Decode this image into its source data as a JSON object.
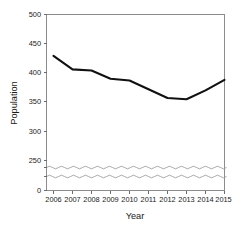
{
  "chart_data": {
    "type": "line",
    "title": "",
    "xlabel": "Year",
    "ylabel": "Population",
    "categories": [
      "2006",
      "2007",
      "2008",
      "2009",
      "2010",
      "2011",
      "2012",
      "2013",
      "2014",
      "2015"
    ],
    "x": [
      2006,
      2007,
      2008,
      2009,
      2010,
      2011,
      2012,
      2013,
      2014,
      2015
    ],
    "values": [
      429,
      406,
      404,
      390,
      387,
      372,
      357,
      355,
      370,
      388
    ],
    "series": [
      {
        "name": "Population",
        "values": [
          429,
          406,
          404,
          390,
          387,
          372,
          357,
          355,
          370,
          388
        ],
        "color": "#111111",
        "marker": "none",
        "line_width": 2
      }
    ],
    "xlim": [
      2006,
      2015
    ],
    "ylim": [
      250,
      500
    ],
    "ytick_labels": [
      "0",
      "250",
      "300",
      "350",
      "400",
      "450",
      "500"
    ],
    "ytick_values": [
      0,
      250,
      300,
      350,
      400,
      450,
      500
    ],
    "xtick_labels": [
      "2006",
      "2007",
      "2008",
      "2009",
      "2010",
      "2011",
      "2012",
      "2013",
      "2014",
      "2015"
    ],
    "axis_break": {
      "present": true,
      "style": "wavy",
      "between": [
        0,
        250
      ],
      "line_count": 2
    },
    "grid": false,
    "legend": null,
    "legend_position": "none",
    "background_color": "#ffffff",
    "frame_color": "#8c8c8c",
    "annotations": []
  },
  "axes": {
    "y_title": "Population",
    "x_title": "Year",
    "y_ticks": [
      {
        "label": "500",
        "value": 500
      },
      {
        "label": "450",
        "value": 450
      },
      {
        "label": "400",
        "value": 400
      },
      {
        "label": "350",
        "value": 350
      },
      {
        "label": "300",
        "value": 300
      },
      {
        "label": "250",
        "value": 250
      },
      {
        "label": "0",
        "value": 0
      }
    ],
    "x_ticks": [
      {
        "label": "2006"
      },
      {
        "label": "2007"
      },
      {
        "label": "2008"
      },
      {
        "label": "2009"
      },
      {
        "label": "2010"
      },
      {
        "label": "2011"
      },
      {
        "label": "2012"
      },
      {
        "label": "2013"
      },
      {
        "label": "2014"
      },
      {
        "label": "2015"
      }
    ]
  }
}
